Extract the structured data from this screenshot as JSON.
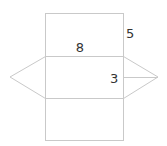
{
  "diagram": {
    "type": "triangular-prism-net",
    "labels": {
      "length": "8",
      "height": "5",
      "triangle_height": "3"
    },
    "colors": {
      "line": "#c9c9c9",
      "text": "#333333",
      "background": "#ffffff"
    }
  }
}
